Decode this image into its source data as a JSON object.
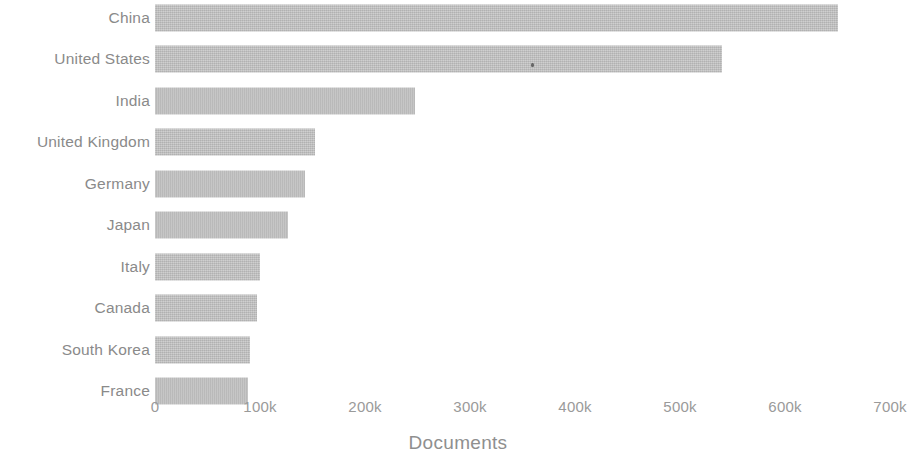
{
  "chart_data": {
    "type": "bar",
    "orientation": "horizontal",
    "title": "",
    "xlabel": "Documents",
    "ylabel": "",
    "categories": [
      "China",
      "United States",
      "India",
      "United Kingdom",
      "Germany",
      "Japan",
      "Italy",
      "Canada",
      "South Korea",
      "France"
    ],
    "values": [
      650000,
      540000,
      248000,
      152000,
      143000,
      127000,
      100000,
      97000,
      90000,
      89000
    ],
    "xlim": [
      0,
      700000
    ],
    "xticks": [
      0,
      100000,
      200000,
      300000,
      400000,
      500000,
      600000,
      700000
    ],
    "xticklabels": [
      "0",
      "100k",
      "200k",
      "300k",
      "400k",
      "500k",
      "600k",
      "700k"
    ],
    "grid": false,
    "legend": null,
    "bar_color": "#c2c2c2",
    "text_color": "#8a8a8a"
  },
  "axis": {
    "x_title": "Documents",
    "ticks": [
      {
        "label": "0",
        "value": 0
      },
      {
        "label": "100k",
        "value": 100000
      },
      {
        "label": "200k",
        "value": 200000
      },
      {
        "label": "300k",
        "value": 300000
      },
      {
        "label": "400k",
        "value": 400000
      },
      {
        "label": "500k",
        "value": 500000
      },
      {
        "label": "600k",
        "value": 600000
      },
      {
        "label": "700k",
        "value": 700000
      }
    ]
  },
  "bars": [
    {
      "label": "China",
      "value": 650000
    },
    {
      "label": "United States",
      "value": 540000
    },
    {
      "label": "India",
      "value": 248000
    },
    {
      "label": "United Kingdom",
      "value": 152000
    },
    {
      "label": "Germany",
      "value": 143000
    },
    {
      "label": "Japan",
      "value": 127000
    },
    {
      "label": "Italy",
      "value": 100000
    },
    {
      "label": "Canada",
      "value": 97000
    },
    {
      "label": "South Korea",
      "value": 90000
    },
    {
      "label": "France",
      "value": 89000
    }
  ]
}
